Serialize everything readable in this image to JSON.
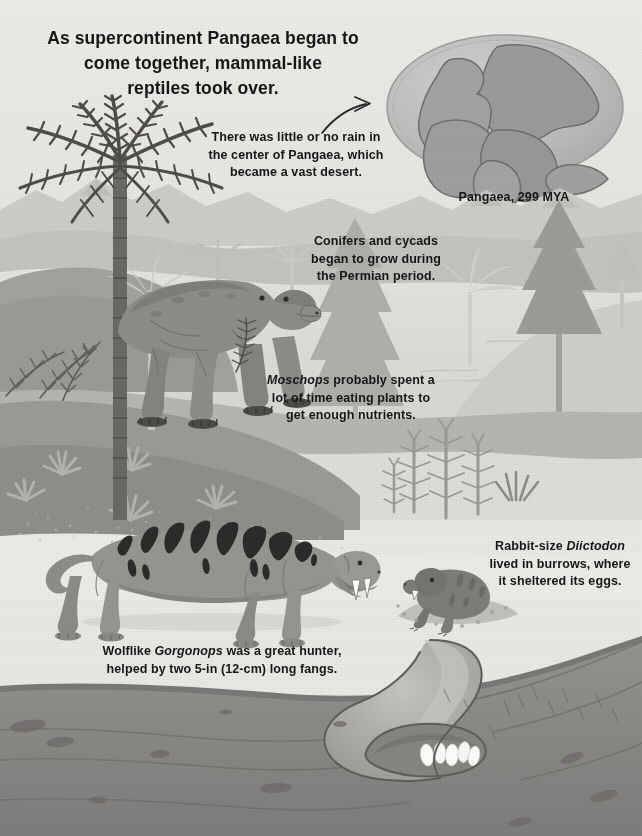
{
  "page": {
    "title": "As supercontinent Pangaea began to\ncome together, mammal-like\nreptiles took over.",
    "width": 642,
    "height": 836,
    "style": "grayscale prehistoric Permian landscape illustration"
  },
  "captions": {
    "rain": "There was little or no rain in\nthe center of Pangaea, which\nbecame a vast desert.",
    "globe_label": "Pangaea, 299 MYA",
    "conifers": "Conifers and cycads\nbegan to grow during\nthe Permian period.",
    "moschops_pre": "",
    "moschops_name": "Moschops",
    "moschops_rest": " probably spent a\nlot of time eating plants to\nget enough nutrients.",
    "diictodon_pre": "Rabbit-size ",
    "diictodon_name": "Diictodon",
    "diictodon_rest": "\nlived in burrows, where\nit sheltered its eggs.",
    "gorgonops_pre": "Wolflike ",
    "gorgonops_name": "Gorgonops",
    "gorgonops_rest": " was a great hunter,\nhelped by two 5-in (12-cm) long fangs."
  },
  "scene": {
    "sky": "#ebe9e6",
    "globe_ocean": "#bcbcbc",
    "globe_land": "#9a9a9a",
    "far_hills": "#c9c7c4",
    "mid_hills": "#bab8b5",
    "water": "#dcdad7",
    "dark_ridge": "#8f8d8a",
    "ground_upper": "#9c9a97",
    "soil": "#8a8886",
    "soil_dark": "#6f6d6b",
    "burrow_wall": "#b9b7b4",
    "egg": "#fbfbfa",
    "moschops_body": "#8e8c89",
    "moschops_shade": "#7b7976",
    "gorgonops_body": "#96948f",
    "gorgonops_stripe": "#2b2b2b",
    "diictodon_body": "#7e7c79",
    "palm_dark": "#6a6865",
    "conifer_dark": "#93918e",
    "conifer_mid": "#b3b1ae",
    "conifer_light": "#cfcdca",
    "fern_dark": "#5f5d5a",
    "ink": "#161616"
  },
  "elements": {
    "globe": {
      "name": "pangaea-globe",
      "shape": "ellipse",
      "landmasses": 5
    },
    "arrow": {
      "name": "curved-arrow",
      "direction": "up-right"
    },
    "animals": [
      {
        "name": "moschops",
        "pose": "standing, eating fern"
      },
      {
        "name": "gorgonops",
        "pose": "walking, fangs bared",
        "stripes": true
      },
      {
        "name": "diictodon",
        "pose": "emerging from burrow"
      }
    ],
    "eggs": {
      "count": 5,
      "location": "burrow chamber"
    },
    "plants": {
      "palm_trees": 2,
      "conifers": 4,
      "horsetails": 4,
      "ferns": 3,
      "shrubs": 6
    }
  }
}
